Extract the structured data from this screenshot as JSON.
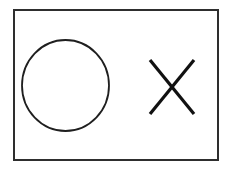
{
  "canvas": {
    "width": 229,
    "height": 171,
    "background_color": "#ffffff"
  },
  "figure": {
    "frame": {
      "name": "outer-rectangle",
      "x": 14,
      "y": 10,
      "width": 204,
      "height": 150,
      "stroke_color": "#2e2e2e",
      "stroke_width": 2,
      "fill": "none"
    },
    "shapes": [
      {
        "name": "circle",
        "type": "ellipse",
        "cx": 65.5,
        "cy": 85.5,
        "rx": 43.5,
        "ry": 45.5,
        "stroke_color": "#1f1f1f",
        "stroke_width": 1.8,
        "fill": "none"
      },
      {
        "name": "x-mark",
        "type": "cross",
        "stroke_color": "#111111",
        "stroke_width": 3.2,
        "strokes": [
          {
            "name": "x-stroke-down",
            "x1": 150,
            "y1": 60,
            "x2": 194,
            "y2": 114
          },
          {
            "name": "x-stroke-up",
            "x1": 150,
            "y1": 114,
            "x2": 194,
            "y2": 60
          }
        ]
      }
    ]
  }
}
